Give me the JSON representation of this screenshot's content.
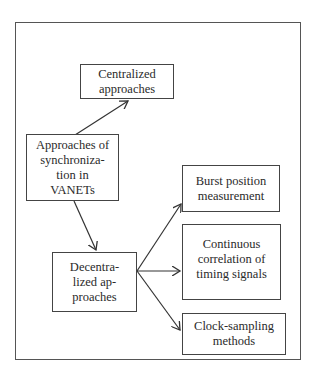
{
  "diagram": {
    "type": "flowchart",
    "root": {
      "id": "root",
      "label": "Approaches of synchroniza-tion in VANETs",
      "lines": [
        "Approaches of",
        "synchroniza-",
        "tion in",
        "VANETs"
      ]
    },
    "nodes": {
      "centralized": {
        "label": "Centralized approaches",
        "lines": [
          "Centralized",
          "approaches"
        ]
      },
      "decentralized": {
        "label": "Decentra-lized ap-proaches",
        "lines": [
          "Decentra-",
          "lized ap-",
          "proaches"
        ]
      },
      "burst": {
        "label": "Burst position measurement",
        "lines": [
          "Burst position",
          "measurement"
        ]
      },
      "continuous": {
        "label": "Continuous correlation of timing signals",
        "lines": [
          "Continuous",
          "correlation of",
          "timing signals"
        ]
      },
      "clock": {
        "label": "Clock-sampling methods",
        "lines": [
          "Clock-sampling",
          "methods"
        ]
      }
    },
    "edges": [
      {
        "from": "root",
        "to": "centralized"
      },
      {
        "from": "root",
        "to": "decentralized"
      },
      {
        "from": "decentralized",
        "to": "burst"
      },
      {
        "from": "decentralized",
        "to": "continuous"
      },
      {
        "from": "decentralized",
        "to": "clock"
      }
    ],
    "colors": {
      "line": "#333333",
      "border": "#444444",
      "background": "#ffffff"
    }
  }
}
